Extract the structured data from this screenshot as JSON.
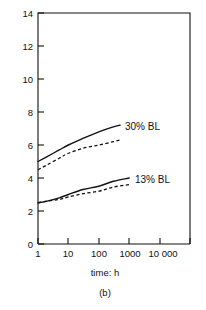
{
  "chart_data": {
    "type": "line",
    "title": "",
    "subtitle": "",
    "caption": "(b)",
    "xlabel": "time: h",
    "ylabel": "",
    "xscale": "log",
    "xlim": [
      1,
      100000
    ],
    "ylim": [
      0,
      14
    ],
    "grid": false,
    "legend_position": "inline-annotation",
    "x_tick_labels": [
      "1",
      "10",
      "100",
      "1000",
      "10 000"
    ],
    "x_tick_values": [
      1,
      10,
      100,
      1000,
      10000
    ],
    "y_tick_labels": [
      "0",
      "2",
      "4",
      "6",
      "8",
      "10",
      "12",
      "14"
    ],
    "y_tick_values": [
      0,
      2,
      4,
      6,
      8,
      10,
      12,
      14
    ],
    "annotations": [
      {
        "text": "30% BL",
        "x": 800,
        "y": 6.9
      },
      {
        "text": "13% BL",
        "x": 2200,
        "y": 4.1
      }
    ],
    "series": [
      {
        "name": "30% BL solid",
        "group": "30% BL",
        "style": "solid",
        "x": [
          1,
          2,
          5,
          10,
          30,
          100,
          300,
          500
        ],
        "values": [
          5.0,
          5.3,
          5.7,
          6.0,
          6.4,
          6.8,
          7.1,
          7.2
        ]
      },
      {
        "name": "30% BL dashed",
        "group": "30% BL",
        "style": "dashed",
        "x": [
          1,
          2,
          5,
          10,
          30,
          100,
          300,
          500
        ],
        "values": [
          4.5,
          4.8,
          5.2,
          5.5,
          5.8,
          6.0,
          6.2,
          6.3
        ]
      },
      {
        "name": "13% BL solid",
        "group": "13% BL",
        "style": "solid",
        "x": [
          1,
          2,
          5,
          10,
          30,
          100,
          300,
          1000
        ],
        "values": [
          2.5,
          2.6,
          2.8,
          3.0,
          3.3,
          3.5,
          3.8,
          4.0
        ]
      },
      {
        "name": "13% BL dashed",
        "group": "13% BL",
        "style": "dashed",
        "x": [
          1,
          2,
          5,
          10,
          30,
          100,
          300,
          1000
        ],
        "values": [
          2.5,
          2.6,
          2.7,
          2.85,
          3.05,
          3.2,
          3.45,
          3.6
        ]
      }
    ]
  },
  "labels": {
    "y_0": "0",
    "y_2": "2",
    "y_4": "4",
    "y_6": "6",
    "y_8": "8",
    "y_10": "10",
    "y_12": "12",
    "y_14": "14",
    "x_1": "1",
    "x_10": "10",
    "x_100": "100",
    "x_1000": "1000",
    "x_10000": "10 000",
    "xaxis_title": "time: h",
    "series_30": "30% BL",
    "series_13": "13% BL",
    "caption": "(b)"
  },
  "colors": {
    "ink": "#111111",
    "background": "#ffffff"
  }
}
